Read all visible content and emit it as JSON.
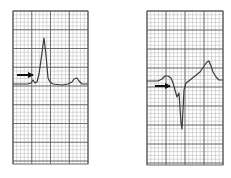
{
  "figure": {
    "background": "#ffffff",
    "grid_minor_color": "#b5b5b5",
    "grid_major_color": "#555555",
    "trace_color": "#3a3a3a",
    "arrow_color": "#111111",
    "panels": [
      {
        "id": "left",
        "description": "ECG strip with tall narrow R wave preceded by slurred upstroke (delta wave), arrow pointing at upstroke",
        "grid": {
          "x": 13,
          "y": 11,
          "width": 75,
          "height": 153,
          "minor": 3.75,
          "major": 18.75
        },
        "trace": "M13,84 L28,84 L31,83 L33,80 L35,83 L37,82 L39,74 L41,60 L43,45 L44,38 L46,55 L48,78 L50,82 L53,84 L62,85 L68,84 L72,82 L74,79 L77,78 L79,81 L82,84 L88,84",
        "arrow": {
          "x1": 17,
          "y1": 75,
          "x2": 36,
          "y2": 75
        }
      },
      {
        "id": "right",
        "description": "ECG strip with negative delta wave and deep narrow Q/S deflection followed by upsloping ST and peaked T wave, arrow pointing at pre-excitation",
        "grid": {
          "x": 147,
          "y": 11,
          "width": 76,
          "height": 154,
          "minor": 3.8,
          "major": 19
        },
        "trace": "M147,81 L158,81 L162,79 L165,76 L168,76 L171,78 L173,83 L175,90 L177,97 L179,93 L180,108 L181,123 L182,129 L183,110 L184,90 L186,83 L190,80 L195,76 L200,72 L204,66 L207,62 L209,61 L211,66 L213,72 L216,77 L219,80 L223,80",
        "arrow": {
          "x1": 155,
          "y1": 86,
          "x2": 173,
          "y2": 86
        }
      }
    ]
  }
}
